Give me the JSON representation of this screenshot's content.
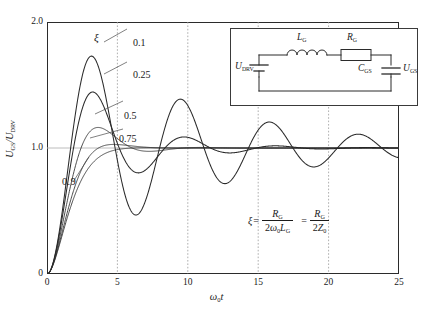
{
  "chart_data": {
    "type": "line",
    "title": "",
    "xlabel": "ω₀t",
    "ylabel": "U_GS / U_DRV",
    "xlim": [
      0,
      25
    ],
    "ylim": [
      0,
      2.0
    ],
    "xticks": [
      "0",
      "5",
      "10",
      "15",
      "20",
      "25"
    ],
    "yticks": [
      "0",
      "1.0",
      "2.0"
    ],
    "grid": "dotted vertical gridlines at x = 5, 10, 15, 20; solid light horizontal gridline at y = 1.0",
    "legend_position": "inline curve labels at left of plot",
    "series": [
      {
        "name": "0.1",
        "damping_ratio": 0.1,
        "x": [
          0,
          0.5,
          1,
          1.5,
          2,
          2.5,
          3,
          3.5,
          4,
          4.5,
          5,
          5.5,
          6,
          6.5,
          7,
          7.5,
          8,
          8.5,
          9,
          9.5,
          10,
          10.5,
          11,
          11.5,
          12,
          12.5,
          13,
          13.5,
          14,
          14.5,
          15,
          15.5,
          16,
          16.5,
          17,
          17.5,
          18,
          18.5,
          19,
          19.5,
          20,
          20.5,
          21,
          21.5,
          22,
          22.5,
          23,
          23.5,
          24,
          24.5,
          25
        ],
        "y": [
          0,
          0.113,
          0.414,
          0.8,
          1.154,
          1.401,
          1.51,
          1.478,
          1.334,
          1.124,
          0.903,
          0.717,
          0.598,
          0.56,
          0.6,
          0.701,
          0.84,
          0.987,
          1.115,
          1.204,
          1.243,
          1.231,
          1.177,
          1.095,
          1.003,
          0.918,
          0.855,
          0.823,
          0.824,
          0.856,
          0.911,
          0.979,
          1.048,
          1.107,
          1.146,
          1.161,
          1.151,
          1.119,
          1.073,
          1.02,
          0.968,
          0.925,
          0.897,
          0.886,
          0.892,
          0.914,
          0.947,
          0.986,
          1.025,
          1.059,
          1.083
        ]
      },
      {
        "name": "0.25",
        "damping_ratio": 0.25,
        "x": [
          0,
          0.5,
          1,
          1.5,
          2,
          2.5,
          3,
          3.5,
          4,
          4.5,
          5,
          5.5,
          6,
          6.5,
          7,
          7.5,
          8,
          8.5,
          9,
          9.5,
          10,
          10.5,
          11,
          11.5,
          12,
          12.5,
          13,
          13.5,
          14,
          14.5,
          15,
          15.5,
          16,
          16.5,
          17,
          17.5,
          18,
          18.5,
          19,
          19.5,
          20,
          20.5,
          21,
          21.5,
          22,
          22.5,
          23,
          23.5,
          24,
          24.5,
          25
        ],
        "y": [
          0,
          0.106,
          0.377,
          0.704,
          0.984,
          1.16,
          1.22,
          1.182,
          1.083,
          0.964,
          0.861,
          0.798,
          0.784,
          0.812,
          0.867,
          0.931,
          0.987,
          1.025,
          1.04,
          1.033,
          1.011,
          0.982,
          0.955,
          0.938,
          0.933,
          0.94,
          0.956,
          0.975,
          0.993,
          1.006,
          1.012,
          1.011,
          1.005,
          0.996,
          0.988,
          0.982,
          0.98,
          0.982,
          0.987,
          0.993,
          0.999,
          1.003,
          1.005,
          1.005,
          1.003,
          1.0,
          0.997,
          0.995,
          0.994,
          0.995,
          0.996
        ]
      },
      {
        "name": "0.5",
        "damping_ratio": 0.5,
        "x": [
          0,
          0.5,
          1,
          1.5,
          2,
          2.5,
          3,
          3.5,
          4,
          4.5,
          5,
          5.5,
          6,
          6.5,
          7,
          7.5,
          8,
          8.5,
          9,
          9.5,
          10,
          10.5,
          11,
          11.5,
          12,
          12.5,
          13,
          13.5,
          14,
          14.5,
          15,
          15.5,
          16,
          16.5,
          17,
          17.5,
          18,
          18.5,
          19,
          19.5,
          20,
          20.5,
          21,
          21.5,
          22,
          22.5,
          23,
          23.5,
          24,
          24.5,
          25
        ],
        "y": [
          0,
          0.093,
          0.31,
          0.558,
          0.763,
          0.894,
          0.952,
          0.958,
          0.938,
          0.913,
          0.897,
          0.894,
          0.901,
          0.913,
          0.926,
          0.937,
          0.944,
          0.948,
          0.949,
          0.948,
          0.947,
          0.946,
          0.947,
          0.948,
          0.95,
          0.952,
          0.953,
          0.954,
          0.954,
          0.954,
          0.954,
          0.954,
          0.954,
          0.954,
          0.954,
          0.954,
          0.954,
          0.954,
          0.954,
          0.954,
          0.954,
          0.954,
          0.954,
          0.954,
          0.954,
          0.954,
          0.954,
          0.954,
          0.954,
          0.954,
          0.954
        ]
      },
      {
        "name": "0.75",
        "damping_ratio": 0.75,
        "x": [
          0,
          0.5,
          1,
          1.5,
          2,
          2.5,
          3,
          3.5,
          4,
          4.5,
          5,
          5.5,
          6,
          6.5,
          7,
          7.5,
          8,
          8.5,
          9,
          9.5,
          10,
          10.5,
          11,
          11.5,
          12,
          12.5,
          13,
          13.5,
          14,
          14.5,
          15,
          15.5,
          16,
          16.5,
          17,
          17.5,
          18,
          18.5,
          19,
          19.5,
          20,
          20.5,
          21,
          21.5,
          22,
          22.5,
          23,
          23.5,
          24,
          24.5,
          25
        ],
        "y": [
          0,
          0.08,
          0.253,
          0.443,
          0.598,
          0.707,
          0.777,
          0.818,
          0.842,
          0.857,
          0.866,
          0.873,
          0.878,
          0.882,
          0.885,
          0.887,
          0.889,
          0.89,
          0.891,
          0.892,
          0.892,
          0.893,
          0.893,
          0.893,
          0.893,
          0.893,
          0.893,
          0.893,
          0.893,
          0.893,
          0.893,
          0.893,
          0.893,
          0.893,
          0.893,
          0.893,
          0.893,
          0.893,
          0.893,
          0.893,
          0.893,
          0.893,
          0.893,
          0.893,
          0.893,
          0.893,
          0.893,
          0.893,
          0.893,
          0.893,
          0.893
        ]
      },
      {
        "name": "0.9",
        "damping_ratio": 0.9,
        "x": [
          0,
          0.5,
          1,
          1.5,
          2,
          2.5,
          3,
          3.5,
          4,
          4.5,
          5,
          5.5,
          6,
          6.5,
          7,
          7.5,
          8,
          8.5,
          9,
          9.5,
          10,
          10.5,
          11,
          11.5,
          12,
          12.5,
          13,
          13.5,
          14,
          14.5,
          15,
          15.5,
          16,
          16.5,
          17,
          17.5,
          18,
          18.5,
          19,
          19.5,
          20,
          20.5,
          21,
          21.5,
          22,
          22.5,
          23,
          23.5,
          24,
          24.5,
          25
        ],
        "y": [
          0,
          0.072,
          0.222,
          0.386,
          0.52,
          0.619,
          0.688,
          0.735,
          0.767,
          0.789,
          0.804,
          0.814,
          0.821,
          0.826,
          0.829,
          0.832,
          0.833,
          0.835,
          0.836,
          0.836,
          0.837,
          0.837,
          0.837,
          0.838,
          0.838,
          0.838,
          0.838,
          0.838,
          0.838,
          0.838,
          0.838,
          0.838,
          0.838,
          0.838,
          0.838,
          0.838,
          0.838,
          0.838,
          0.838,
          0.838,
          0.838,
          0.838,
          0.838,
          0.838,
          0.838,
          0.838,
          0.838,
          0.838,
          0.838,
          0.838,
          0.838
        ]
      }
    ],
    "annotations": {
      "xi_symbol": "ξ",
      "curve_labels": [
        "0.1",
        "0.25",
        "0.5",
        "0.75",
        "0.9"
      ],
      "equation_text": "ξ = R_G / (2ω₀L_G) = R_G / (2Z₀)"
    },
    "colors": {
      "curve": "#2b2b2b",
      "frame": "#2b2b2b",
      "gridline": "#9a9a9a",
      "background": "#ffffff"
    }
  },
  "axes": {
    "y_ticks": [
      {
        "label": "2.0",
        "value": 2.0
      },
      {
        "label": "1.0",
        "value": 1.0
      },
      {
        "label": "0",
        "value": 0
      }
    ],
    "x_ticks": [
      {
        "label": "0",
        "value": 0
      },
      {
        "label": "5",
        "value": 5
      },
      {
        "label": "10",
        "value": 10
      },
      {
        "label": "15",
        "value": 15
      },
      {
        "label": "20",
        "value": 20
      },
      {
        "label": "25",
        "value": 25
      }
    ],
    "y_title": {
      "num": "U",
      "num_sub": "GS",
      "den": "U",
      "den_sub": "DRV"
    },
    "x_title": {
      "sym": "ω",
      "sub": "0",
      "var": "t"
    }
  },
  "curve_labels": {
    "xi": "ξ",
    "items": [
      {
        "label": "0.1"
      },
      {
        "label": "0.25"
      },
      {
        "label": "0.5"
      },
      {
        "label": "0.75"
      },
      {
        "label": "0.9"
      }
    ]
  },
  "inset_circuit": {
    "source": {
      "sym": "U",
      "sub": "DRV"
    },
    "inductor": {
      "sym": "L",
      "sub": "G"
    },
    "resistor": {
      "sym": "R",
      "sub": "G"
    },
    "capacitor": {
      "sym": "C",
      "sub": "GS"
    },
    "output": {
      "sym": "U",
      "sub": "GS"
    }
  },
  "equation": {
    "lhs": "ξ",
    "eq1": "=",
    "num1": {
      "sym": "R",
      "sub": "G"
    },
    "den1": {
      "two": "2",
      "omega": "ω",
      "osub": "0",
      "l": "L",
      "lsub": "G"
    },
    "eq2": "=",
    "num2": {
      "sym": "R",
      "sub": "G"
    },
    "den2": {
      "two": "2",
      "z": "Z",
      "zsub": "0"
    }
  }
}
